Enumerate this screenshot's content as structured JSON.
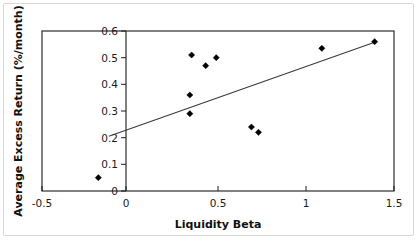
{
  "chart_data": {
    "type": "scatter",
    "title": "",
    "xlabel": "Liquidity Beta",
    "ylabel": "Average Excess Return (%/month)",
    "xlim": [
      -0.5,
      1.5
    ],
    "ylim": [
      0,
      0.6
    ],
    "xticks": [
      -0.5,
      0,
      0.5,
      1,
      1.5
    ],
    "xtick_labels": [
      "-0.5",
      "0",
      "0.5",
      "1",
      "1.5"
    ],
    "yticks": [
      0,
      0.1,
      0.2,
      0.3,
      0.4,
      0.5,
      0.6
    ],
    "ytick_labels": [
      "0",
      "0.1",
      "0.2",
      "0.3",
      "0.4",
      "0.5",
      "0.6"
    ],
    "grid": false,
    "legend": "none",
    "marker": "diamond",
    "marker_color": "#000000",
    "points": [
      {
        "x": -0.18,
        "y": 0.05
      },
      {
        "x": 0.34,
        "y": 0.29
      },
      {
        "x": 0.34,
        "y": 0.36
      },
      {
        "x": 0.35,
        "y": 0.51
      },
      {
        "x": 0.43,
        "y": 0.47
      },
      {
        "x": 0.49,
        "y": 0.5
      },
      {
        "x": 0.69,
        "y": 0.24
      },
      {
        "x": 0.73,
        "y": 0.22
      },
      {
        "x": 1.09,
        "y": 0.535
      },
      {
        "x": 1.39,
        "y": 0.56
      }
    ],
    "series": [
      {
        "name": "Portfolios",
        "x": [
          -0.18,
          0.34,
          0.34,
          0.35,
          0.43,
          0.49,
          0.69,
          0.73,
          1.09,
          1.39
        ],
        "values": [
          0.05,
          0.29,
          0.36,
          0.51,
          0.47,
          0.5,
          0.24,
          0.22,
          0.535,
          0.56
        ]
      }
    ],
    "trend_line": {
      "name": "fitted regression line",
      "color": "#3a3a3a",
      "x_start": -0.12,
      "y_start": 0.205,
      "x_end": 1.39,
      "y_end": 0.558
    },
    "y_axis_position_x": 0
  },
  "figure": {
    "background": "#ffffff",
    "border_color": "#d8d8d8",
    "axis_color": "#1a1a1a"
  }
}
